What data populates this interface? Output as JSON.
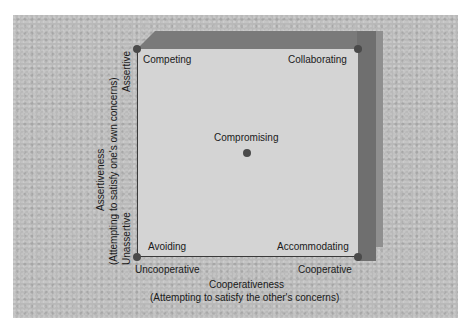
{
  "diagram": {
    "modes": {
      "top_left": "Competing",
      "top_right": "Collaborating",
      "center": "Compromising",
      "bottom_left": "Avoiding",
      "bottom_right": "Accommodating"
    },
    "y_axis": {
      "name": "Assertiveness",
      "description": "(Attempting to satisfy one's own concerns)",
      "high": "Assertive",
      "low": "Unassertive"
    },
    "x_axis": {
      "name": "Cooperativeness",
      "description": "(Attempting to satisfy the other's concerns)",
      "low": "Uncooperative",
      "high": "Cooperative"
    },
    "colors": {
      "background": "#b9b9b9",
      "front_face": "#d4d4d4",
      "slab": "#7a7a7a",
      "dot": "#4a4a4a"
    }
  }
}
